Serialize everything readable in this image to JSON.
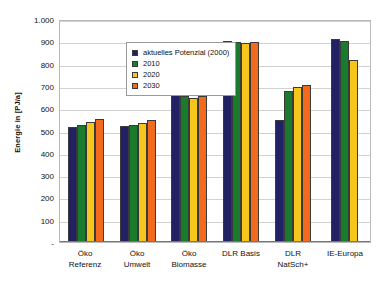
{
  "chart_data": {
    "type": "bar",
    "title": "",
    "xlabel": "",
    "ylabel": "Energie in [PJ/a]",
    "ylim": [
      0,
      1000
    ],
    "ytick_labels": [
      "1.000",
      "900",
      "800",
      "700",
      "600",
      "500",
      "400",
      "300",
      "200",
      "100",
      "-"
    ],
    "ytick_values": [
      1000,
      900,
      800,
      700,
      600,
      500,
      400,
      300,
      200,
      100,
      0
    ],
    "grid": true,
    "legend_position": "upper-left-inside",
    "categories": [
      "Öko Referenz",
      "Öko Umwelt",
      "Öko Biomasse",
      "DLR Basis",
      "DLR NatSch+",
      "IE-Europa"
    ],
    "category_lines": [
      [
        "Öko",
        "Referenz"
      ],
      [
        "Öko",
        "Umwelt"
      ],
      [
        "Öko",
        "Biomasse"
      ],
      [
        "DLR Basis",
        ""
      ],
      [
        "DLR",
        "NatSch+"
      ],
      [
        "IE-Europa",
        ""
      ]
    ],
    "series": [
      {
        "name": "aktuelles Potenzial (2000)",
        "color": "#212163",
        "values": [
          518,
          520,
          675,
          903,
          545,
          910
        ]
      },
      {
        "name": "2010",
        "color": "#1a7a2e",
        "values": [
          525,
          525,
          653,
          895,
          675,
          900
        ]
      },
      {
        "name": "2020",
        "color": "#f6c61c",
        "values": [
          537,
          535,
          647,
          892,
          697,
          818
        ]
      },
      {
        "name": "2030",
        "color": "#f26a1b",
        "values": [
          553,
          545,
          657,
          897,
          705,
          null
        ]
      }
    ]
  }
}
